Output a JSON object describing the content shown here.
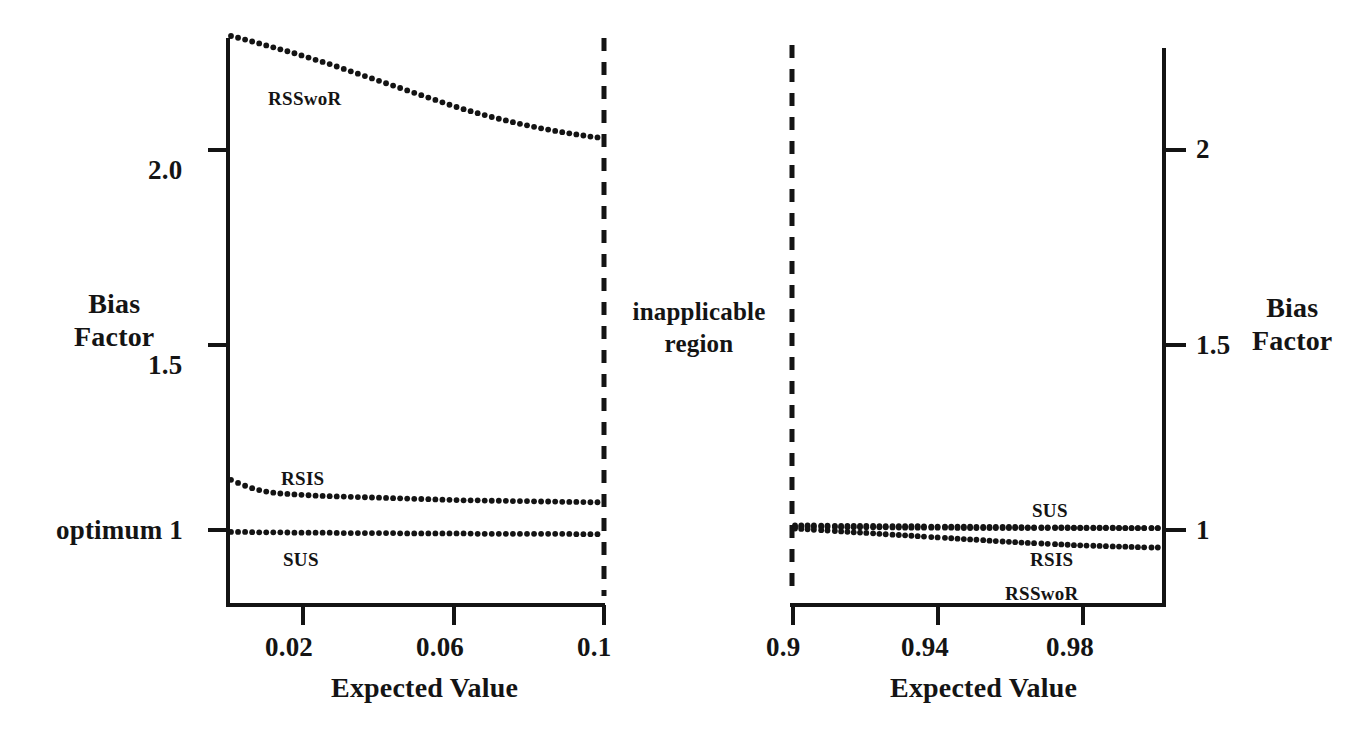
{
  "figure": {
    "background": "#ffffff",
    "ink_color": "#141414",
    "center_note": {
      "line1": "inapplicable",
      "line2": "region"
    },
    "optimum_label": "optimum 1"
  },
  "chart_data": [
    {
      "id": "left-panel",
      "type": "scatter",
      "title": "",
      "xlabel": "Expected Value",
      "ylabel": "Bias Factor",
      "ylabel_lines": [
        "Bias",
        "Factor"
      ],
      "xlim": [
        0.01,
        0.1
      ],
      "ylim": [
        0.9,
        2.38
      ],
      "grid": false,
      "legend": "inline-annotations",
      "xticks": [
        0.02,
        0.06,
        0.1
      ],
      "xticklabels": [
        "0.02",
        "0.06",
        "0.1"
      ],
      "yticks": [
        2.0,
        1.5,
        1.0
      ],
      "yticklabels": [
        "2.0",
        "1.5",
        "optimum 1"
      ],
      "marker": "dotted-trace",
      "series": [
        {
          "name": "RSSwoR",
          "label": "RSSwoR",
          "x": [
            0.01,
            0.013,
            0.016,
            0.019,
            0.022,
            0.025,
            0.028,
            0.031,
            0.034,
            0.037,
            0.04,
            0.043,
            0.046,
            0.049,
            0.052,
            0.055,
            0.058,
            0.061,
            0.064,
            0.067,
            0.07,
            0.073,
            0.076,
            0.079,
            0.082,
            0.085,
            0.088,
            0.091,
            0.094,
            0.097,
            0.1
          ],
          "values": [
            2.3,
            2.292,
            2.283,
            2.274,
            2.265,
            2.256,
            2.246,
            2.236,
            2.226,
            2.215,
            2.204,
            2.193,
            2.182,
            2.171,
            2.16,
            2.149,
            2.138,
            2.127,
            2.116,
            2.106,
            2.097,
            2.088,
            2.08,
            2.072,
            2.065,
            2.058,
            2.052,
            2.046,
            2.041,
            2.036,
            2.032
          ]
        },
        {
          "name": "RSIS",
          "label": "RSIS",
          "x": [
            0.01,
            0.013,
            0.016,
            0.019,
            0.022,
            0.025,
            0.028,
            0.031,
            0.034,
            0.037,
            0.04,
            0.043,
            0.046,
            0.049,
            0.052,
            0.055,
            0.058,
            0.061,
            0.064,
            0.067,
            0.07,
            0.073,
            0.076,
            0.079,
            0.082,
            0.085,
            0.088,
            0.091,
            0.094,
            0.097,
            0.1
          ],
          "values": [
            1.132,
            1.118,
            1.107,
            1.1,
            1.096,
            1.094,
            1.092,
            1.09,
            1.089,
            1.088,
            1.087,
            1.086,
            1.085,
            1.084,
            1.083,
            1.082,
            1.081,
            1.08,
            1.079,
            1.078,
            1.078,
            1.077,
            1.077,
            1.076,
            1.076,
            1.075,
            1.075,
            1.074,
            1.074,
            1.073,
            1.073
          ]
        },
        {
          "name": "SUS",
          "label": "SUS",
          "x": [
            0.01,
            0.013,
            0.016,
            0.019,
            0.022,
            0.025,
            0.028,
            0.031,
            0.034,
            0.037,
            0.04,
            0.043,
            0.046,
            0.049,
            0.052,
            0.055,
            0.058,
            0.061,
            0.064,
            0.067,
            0.07,
            0.073,
            0.076,
            0.079,
            0.082,
            0.085,
            0.088,
            0.091,
            0.094,
            0.097,
            0.1
          ],
          "values": [
            0.995,
            0.995,
            0.994,
            0.994,
            0.994,
            0.993,
            0.993,
            0.993,
            0.993,
            0.992,
            0.992,
            0.992,
            0.992,
            0.992,
            0.991,
            0.991,
            0.991,
            0.991,
            0.991,
            0.991,
            0.99,
            0.99,
            0.99,
            0.99,
            0.99,
            0.99,
            0.99,
            0.99,
            0.989,
            0.989,
            0.989
          ]
        }
      ]
    },
    {
      "id": "right-panel",
      "type": "scatter",
      "title": "",
      "xlabel": "Expected Value",
      "ylabel": "Bias Factor",
      "ylabel_lines": [
        "Bias",
        "Factor"
      ],
      "xlim": [
        0.9,
        1.0
      ],
      "ylim": [
        0.9,
        2.38
      ],
      "grid": false,
      "legend": "inline-annotations",
      "xticks": [
        0.9,
        0.94,
        0.98
      ],
      "xticklabels": [
        "0.9",
        "0.94",
        "0.98"
      ],
      "yticks": [
        2,
        1.5,
        1
      ],
      "yticklabels": [
        "2",
        "1.5",
        "1"
      ],
      "marker": "dotted-trace",
      "series": [
        {
          "name": "SUS",
          "label": "SUS",
          "x": [
            0.9,
            0.903,
            0.906,
            0.91,
            0.913,
            0.916,
            0.92,
            0.923,
            0.926,
            0.93,
            0.933,
            0.936,
            0.94,
            0.943,
            0.946,
            0.95,
            0.953,
            0.956,
            0.96,
            0.963,
            0.966,
            0.97,
            0.973,
            0.976,
            0.98,
            0.983,
            0.986,
            0.99,
            0.993,
            0.996,
            1.0
          ],
          "values": [
            1.012,
            1.012,
            1.012,
            1.011,
            1.011,
            1.011,
            1.011,
            1.01,
            1.01,
            1.01,
            1.01,
            1.009,
            1.009,
            1.009,
            1.009,
            1.008,
            1.008,
            1.008,
            1.008,
            1.007,
            1.007,
            1.007,
            1.007,
            1.006,
            1.006,
            1.006,
            1.006,
            1.005,
            1.005,
            1.005,
            1.005
          ]
        },
        {
          "name": "RSIS",
          "label": "RSIS",
          "x": [
            0.9,
            0.903,
            0.906,
            0.91,
            0.913,
            0.916,
            0.92,
            0.923,
            0.926,
            0.93,
            0.933,
            0.936,
            0.94,
            0.943,
            0.946,
            0.95,
            0.953,
            0.956,
            0.96,
            0.963,
            0.966,
            0.97,
            0.973,
            0.976,
            0.98,
            0.983,
            0.986,
            0.99,
            0.993,
            0.996,
            1.0
          ],
          "values": [
            1.008,
            1.008,
            1.008,
            1.008,
            1.007,
            1.007,
            1.007,
            1.007,
            1.007,
            1.006,
            1.006,
            1.006,
            1.006,
            1.006,
            1.005,
            1.005,
            1.005,
            1.005,
            1.005,
            1.005,
            1.005,
            1.005,
            1.005,
            1.005,
            1.005,
            1.005,
            1.005,
            1.005,
            1.005,
            1.005,
            1.005
          ]
        },
        {
          "name": "RSSwoR",
          "label": "RSSwoR",
          "x": [
            0.9,
            0.903,
            0.906,
            0.91,
            0.913,
            0.916,
            0.92,
            0.923,
            0.926,
            0.93,
            0.933,
            0.936,
            0.94,
            0.943,
            0.946,
            0.95,
            0.953,
            0.956,
            0.96,
            0.963,
            0.966,
            0.97,
            0.973,
            0.976,
            0.98,
            0.983,
            0.986,
            0.99,
            0.993,
            0.996,
            1.0
          ],
          "values": [
            1.004,
            1.002,
            1.0,
            0.998,
            0.996,
            0.994,
            0.992,
            0.99,
            0.988,
            0.986,
            0.984,
            0.982,
            0.98,
            0.978,
            0.976,
            0.974,
            0.972,
            0.97,
            0.968,
            0.966,
            0.965,
            0.963,
            0.962,
            0.96,
            0.959,
            0.958,
            0.957,
            0.956,
            0.955,
            0.954,
            0.954
          ]
        }
      ]
    }
  ]
}
